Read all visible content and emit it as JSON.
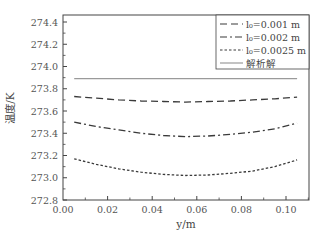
{
  "chart_data": {
    "type": "line",
    "title": "",
    "xlabel": "y/m",
    "ylabel": "温度/K",
    "xlim": [
      0.0,
      0.11
    ],
    "ylim": [
      272.8,
      274.5
    ],
    "xticks": [
      0.0,
      0.02,
      0.04,
      0.06,
      0.08,
      0.1
    ],
    "xtick_labels": [
      "0.00",
      "0.02",
      "0.04",
      "0.06",
      "0.08",
      "0.10"
    ],
    "yticks": [
      272.8,
      273.0,
      273.2,
      273.4,
      273.6,
      273.8,
      274.0,
      274.2,
      274.4
    ],
    "ytick_labels": [
      "272.8",
      "273.0",
      "273.2",
      "273.4",
      "273.6",
      "273.8",
      "274.0",
      "274.2",
      "274.4"
    ],
    "grid": false,
    "legend_position": "upper right",
    "x": [
      0.005,
      0.015,
      0.025,
      0.035,
      0.045,
      0.055,
      0.065,
      0.075,
      0.085,
      0.095,
      0.105
    ],
    "series": [
      {
        "name": "l0=0.001 m",
        "style": "dashed",
        "values": [
          273.73,
          273.715,
          273.7,
          273.69,
          273.685,
          273.68,
          273.685,
          273.69,
          273.7,
          273.71,
          273.725
        ]
      },
      {
        "name": "l0=0.002 m",
        "style": "dash-dot",
        "values": [
          273.5,
          273.46,
          273.43,
          273.4,
          273.38,
          273.37,
          273.375,
          273.39,
          273.41,
          273.44,
          273.49
        ]
      },
      {
        "name": "l0=0.0025 m",
        "style": "dotted",
        "values": [
          273.17,
          273.12,
          273.08,
          273.05,
          273.03,
          273.02,
          273.025,
          273.04,
          273.06,
          273.1,
          273.16
        ]
      },
      {
        "name": "解析解",
        "style": "solid",
        "values": [
          273.89,
          273.89,
          273.89,
          273.89,
          273.89,
          273.89,
          273.89,
          273.89,
          273.89,
          273.89,
          273.89
        ]
      }
    ]
  },
  "legend": {
    "items": [
      {
        "label": "l₀=0.001 m",
        "style": "dashed"
      },
      {
        "label": "l₀=0.002 m",
        "style": "dash-dot"
      },
      {
        "label": "l₀=0.0025 m",
        "style": "dotted"
      },
      {
        "label": "解析解",
        "style": "solid"
      }
    ]
  },
  "colors": {
    "line": "#3a3a3a",
    "analytic": "#9a9a9a",
    "axis": "#444444"
  }
}
